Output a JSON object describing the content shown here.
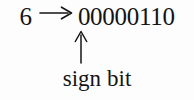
{
  "figure": {
    "name": "sign-bit-illustration",
    "background_color": "#fdfdfd",
    "text_color": "#141414"
  },
  "expression": {
    "decimal_value": "6",
    "maps_to_symbol": "→",
    "binary_value": "00000110",
    "bits": [
      "0",
      "0",
      "0",
      "0",
      "0",
      "1",
      "1",
      "0"
    ],
    "bit_count": 8
  },
  "annotation": {
    "pointer_symbol": "↑",
    "points_at_bit_index": 0,
    "points_at_bit_value": "0",
    "label_part_one": "sign",
    "label_part_two": "bit",
    "label_full": "sign bit"
  }
}
